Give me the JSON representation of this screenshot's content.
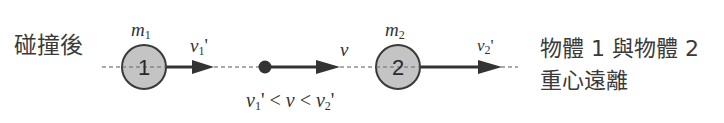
{
  "title": "碰撞後",
  "caption": {
    "line1": "物體 1 與物體 2",
    "line2": "重心遠離"
  },
  "objects": [
    {
      "id": "1",
      "mass_label": "m",
      "mass_sub": "1",
      "velocity_label": "v",
      "velocity_sub": "1",
      "velocity_prime": "'"
    },
    {
      "id": "2",
      "mass_label": "m",
      "mass_sub": "2",
      "velocity_label": "v",
      "velocity_sub": "2",
      "velocity_prime": "'"
    }
  ],
  "center_of_mass": {
    "velocity_label": "v"
  },
  "relation": {
    "v1": "v",
    "v1_sub": "1",
    "prime1": "'",
    "lt1": " < ",
    "v": "v",
    "lt2": " < ",
    "v2": "v",
    "v2_sub": "2",
    "prime2": "'"
  },
  "colors": {
    "ball_fill": "#c4c4c4",
    "ball_stroke": "#3a3a3a",
    "arrow": "#333333",
    "dashed_axis": "#555555",
    "text": "#3a3a3a"
  }
}
